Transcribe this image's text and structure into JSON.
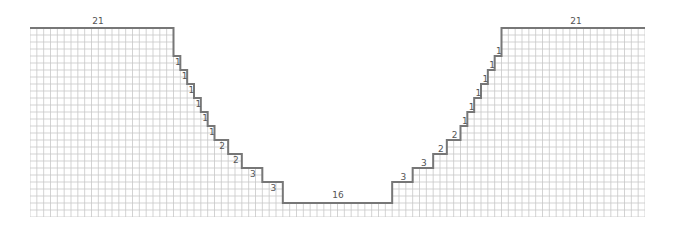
{
  "diagram": {
    "title": "",
    "colors": {
      "grid": "#c8c8c8",
      "outline": "#777777",
      "label": "#555555"
    },
    "grid": {
      "cols": 90,
      "rows": 27
    },
    "top_left_label": "21",
    "top_right_label": "21",
    "bottom_label": "16",
    "left_step_labels": [
      "1",
      "1",
      "1",
      "1",
      "1",
      "1",
      "2",
      "2",
      "3",
      "3"
    ],
    "right_step_labels": [
      "3",
      "3",
      "2",
      "2",
      "1",
      "1",
      "1",
      "1",
      "1",
      "1"
    ]
  }
}
